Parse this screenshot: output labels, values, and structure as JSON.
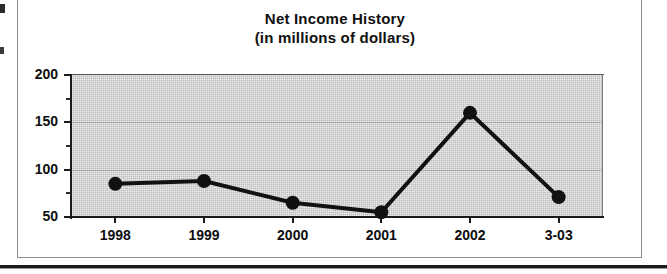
{
  "figure": {
    "title_line1": "Net Income History",
    "title_line2": "(in millions of dollars)"
  },
  "chart_data": {
    "type": "line",
    "title": "Net Income History (in millions of dollars)",
    "xlabel": "",
    "ylabel": "",
    "categories": [
      "1998",
      "1999",
      "2000",
      "2001",
      "2002",
      "3-03"
    ],
    "values": [
      85,
      88,
      65,
      55,
      160,
      71
    ],
    "ylim": [
      50,
      200
    ],
    "yticks": [
      50,
      100,
      150,
      200
    ],
    "ytick_labels": [
      "50",
      "100",
      "150",
      "200"
    ],
    "yticks_minor": [
      75,
      125,
      175
    ],
    "grid": true,
    "legend": false,
    "series_color": "#111111",
    "plot_background": "#ececec",
    "marker": "circle"
  }
}
